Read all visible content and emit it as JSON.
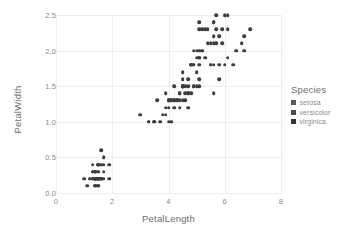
{
  "chart_data": {
    "type": "scatter",
    "title": "",
    "xlabel": "PetalLength",
    "ylabel": "PetalWidth",
    "xlim": [
      0,
      8
    ],
    "ylim": [
      0.0,
      2.5
    ],
    "xticks": [
      "0",
      "2",
      "4",
      "6",
      "8"
    ],
    "xtick_values": [
      0,
      2,
      4,
      6,
      8
    ],
    "yticks": [
      "0.0",
      "0.5",
      "1.0",
      "1.5",
      "2.0",
      "2.5"
    ],
    "ytick_values": [
      0.0,
      0.5,
      1.0,
      1.5,
      2.0,
      2.5
    ],
    "grid": true,
    "legend_position": "right",
    "marker_color": "#3c3c3c",
    "grid_color": "#eceeef",
    "axis_color": "#d9dcde",
    "tick_label_color": "#8a8a8a",
    "axis_title_color": "#6e6e6e",
    "series": [
      {
        "name": "setosa",
        "color": "#3c3c3c",
        "x": [
          1.4,
          1.4,
          1.3,
          1.5,
          1.4,
          1.7,
          1.4,
          1.5,
          1.4,
          1.5,
          1.5,
          1.6,
          1.4,
          1.1,
          1.2,
          1.5,
          1.3,
          1.4,
          1.7,
          1.5,
          1.7,
          1.5,
          1.0,
          1.7,
          1.9,
          1.6,
          1.6,
          1.5,
          1.4,
          1.6,
          1.6,
          1.5,
          1.5,
          1.4,
          1.5,
          1.2,
          1.3,
          1.4,
          1.3,
          1.5,
          1.3,
          1.3,
          1.3,
          1.6,
          1.9,
          1.4,
          1.6,
          1.4,
          1.5,
          1.4
        ],
        "y": [
          0.2,
          0.2,
          0.2,
          0.2,
          0.2,
          0.4,
          0.3,
          0.2,
          0.2,
          0.1,
          0.2,
          0.2,
          0.1,
          0.1,
          0.2,
          0.4,
          0.4,
          0.3,
          0.3,
          0.3,
          0.2,
          0.4,
          0.2,
          0.5,
          0.2,
          0.2,
          0.4,
          0.2,
          0.2,
          0.2,
          0.2,
          0.4,
          0.1,
          0.2,
          0.2,
          0.2,
          0.2,
          0.1,
          0.2,
          0.2,
          0.3,
          0.3,
          0.2,
          0.6,
          0.4,
          0.3,
          0.2,
          0.2,
          0.2,
          0.2
        ]
      },
      {
        "name": "versicolor",
        "color": "#3c3c3c",
        "x": [
          4.7,
          4.5,
          4.9,
          4.0,
          4.6,
          4.5,
          4.7,
          3.3,
          4.6,
          3.9,
          3.5,
          4.2,
          4.0,
          4.7,
          3.6,
          4.4,
          4.5,
          4.1,
          4.5,
          3.9,
          4.8,
          4.0,
          4.9,
          4.7,
          4.3,
          4.4,
          4.8,
          5.0,
          4.5,
          3.5,
          3.8,
          3.7,
          3.9,
          5.1,
          4.5,
          4.5,
          4.7,
          4.4,
          4.1,
          4.0,
          4.4,
          4.6,
          4.0,
          3.3,
          4.2,
          4.2,
          4.2,
          4.3,
          3.0,
          4.1
        ],
        "y": [
          1.4,
          1.5,
          1.5,
          1.3,
          1.5,
          1.3,
          1.6,
          1.0,
          1.3,
          1.4,
          1.0,
          1.5,
          1.0,
          1.4,
          1.3,
          1.4,
          1.5,
          1.0,
          1.5,
          1.1,
          1.8,
          1.3,
          1.5,
          1.2,
          1.3,
          1.4,
          1.4,
          1.7,
          1.5,
          1.0,
          1.1,
          1.0,
          1.2,
          1.6,
          1.5,
          1.6,
          1.5,
          1.3,
          1.3,
          1.3,
          1.2,
          1.4,
          1.2,
          1.0,
          1.3,
          1.2,
          1.3,
          1.3,
          1.1,
          1.3
        ]
      },
      {
        "name": "virginica",
        "color": "#3c3c3c",
        "x": [
          6.0,
          5.1,
          5.9,
          5.6,
          5.8,
          6.6,
          4.5,
          6.3,
          5.8,
          6.1,
          5.1,
          5.3,
          5.5,
          5.0,
          5.1,
          5.3,
          5.5,
          6.7,
          6.9,
          5.0,
          5.7,
          4.9,
          6.7,
          4.9,
          5.7,
          6.0,
          4.8,
          4.9,
          5.6,
          5.8,
          6.1,
          6.4,
          5.6,
          5.1,
          5.6,
          6.1,
          5.6,
          5.5,
          4.8,
          5.4,
          5.6,
          5.1,
          5.1,
          5.9,
          5.7,
          5.2,
          5.0,
          5.2,
          5.4,
          5.1
        ],
        "y": [
          2.5,
          1.9,
          2.1,
          1.8,
          2.2,
          2.1,
          1.7,
          1.8,
          1.8,
          2.5,
          2.0,
          1.9,
          2.1,
          2.0,
          2.4,
          2.3,
          1.8,
          2.2,
          2.3,
          1.5,
          2.3,
          2.0,
          2.0,
          1.8,
          2.1,
          1.8,
          1.8,
          1.8,
          2.1,
          1.6,
          1.9,
          2.0,
          2.2,
          1.5,
          1.4,
          2.3,
          2.4,
          1.8,
          1.8,
          2.1,
          2.4,
          2.3,
          1.9,
          2.3,
          2.5,
          2.3,
          1.9,
          2.0,
          2.3,
          1.8
        ]
      }
    ]
  },
  "legend": {
    "title": "Species",
    "items": [
      {
        "label": "setosa",
        "color": "#595959"
      },
      {
        "label": "versicolor",
        "color": "#4a4a4a"
      },
      {
        "label": "virginica",
        "color": "#333333"
      }
    ]
  }
}
